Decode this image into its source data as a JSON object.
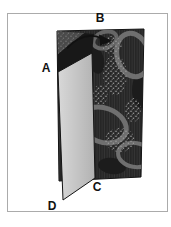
{
  "figure": {
    "labels": {
      "a": "A",
      "b": "B",
      "c": "C",
      "d": "D"
    },
    "colors": {
      "background": "#ffffff",
      "frame_stroke": "#ababab",
      "fabric_base": "#2d2d2d",
      "fabric_stripe": "#1e1e1e",
      "fabric_motif": "#6f6f6f",
      "fabric_speckle": "#9a9a9a",
      "fabric_blob_dark": "#1c1c1c",
      "fold_back": "#181818",
      "fold_corner": "#4a4a4a",
      "flap_light": "#d8d8d8",
      "flap_shade": "#b2b2b2",
      "outline_ink": "#141414",
      "arrow_ink": "#111111",
      "label_ink": "#111111"
    }
  }
}
